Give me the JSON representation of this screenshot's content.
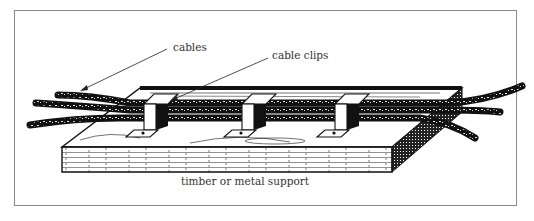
{
  "figure": {
    "type": "technical illustration",
    "labels": {
      "cables": "cables",
      "cable_clips": "cable clips",
      "support": "timber or metal support"
    },
    "components": [
      {
        "name": "cables",
        "count": 3
      },
      {
        "name": "cable clips",
        "count": 3
      },
      {
        "name": "timber or metal support",
        "count": 1
      }
    ],
    "colors": {
      "ink": "#111111",
      "frame": "#8a8a8a",
      "label_text": "#333333",
      "background": "#ffffff"
    }
  }
}
